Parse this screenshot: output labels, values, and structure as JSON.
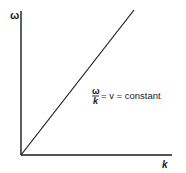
{
  "diagram": {
    "type": "dispersion-relation",
    "axes": {
      "x_label": "k",
      "y_label": "ω"
    },
    "line": {
      "description": "straight line through origin",
      "from": [
        0,
        0
      ],
      "to": [
        1,
        1.26
      ]
    },
    "annotation": {
      "numerator": "ω",
      "denominator": "k",
      "rest": "= v = constant"
    },
    "colors": {
      "ink": "#1a1a1a",
      "background": "#ffffff"
    }
  }
}
